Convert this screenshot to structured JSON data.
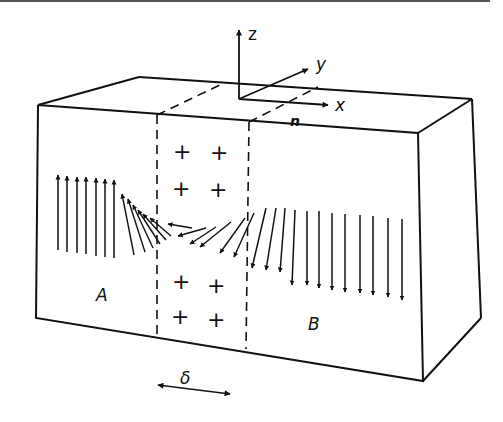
{
  "figure": {
    "axes": {
      "z": "z",
      "y": "y",
      "x": "x",
      "n": "n"
    },
    "regions": {
      "left": "A",
      "right": "B"
    },
    "wall_width_label": "δ",
    "charges": [
      "+",
      "+",
      "+",
      "+",
      "+",
      "+",
      "+",
      "+"
    ],
    "colors": {
      "ink": "#111111",
      "background": "#ffffff"
    }
  }
}
